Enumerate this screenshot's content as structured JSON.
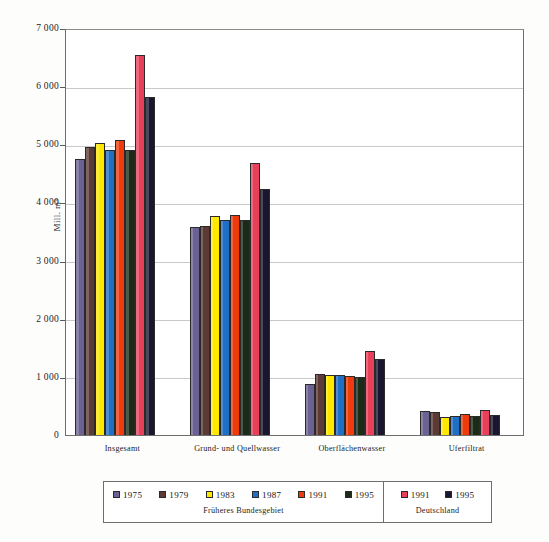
{
  "chart_data": {
    "type": "bar",
    "title": "",
    "xlabel": "",
    "ylabel": "Mill. m³",
    "ylim": [
      0,
      7000
    ],
    "ytick_labels": [
      "0",
      "1 000",
      "2 000",
      "3 000",
      "4 000",
      "5 000",
      "6 000",
      "7 000"
    ],
    "ytick_values": [
      0,
      1000,
      2000,
      3000,
      4000,
      5000,
      6000,
      7000
    ],
    "grid": true,
    "legend_position": "bottom",
    "categories": [
      "Insgesamt",
      "Grund- und Quellwasser",
      "Oberflächenwasser",
      "Uferfiltrat"
    ],
    "series": [
      {
        "name": "1975",
        "region": "Früheres Bundesgebiet",
        "color": "#6B6192",
        "values": [
          4750,
          3570,
          880,
          410
        ]
      },
      {
        "name": "1979",
        "region": "Früheres Bundesgebiet",
        "color": "#5C3A35",
        "values": [
          4950,
          3590,
          1050,
          390
        ]
      },
      {
        "name": "1983",
        "region": "Früheres Bundesgebiet",
        "color": "#FFE800",
        "values": [
          5030,
          3760,
          1040,
          310
        ]
      },
      {
        "name": "1987",
        "region": "Früheres Bundesgebiet",
        "color": "#1F6FC4",
        "values": [
          4910,
          3700,
          1030,
          330
        ]
      },
      {
        "name": "1991",
        "region": "Früheres Bundesgebiet",
        "color": "#EE3B0B",
        "values": [
          5080,
          3790,
          1010,
          360
        ]
      },
      {
        "name": "1995",
        "region": "Früheres Bundesgebiet",
        "color": "#1C2B17",
        "values": [
          4910,
          3700,
          1000,
          330
        ]
      },
      {
        "name": "1991",
        "region": "Deutschland",
        "color": "#E8405A",
        "values": [
          6530,
          4680,
          1450,
          430
        ]
      },
      {
        "name": "1995",
        "region": "Deutschland",
        "color": "#1A1630",
        "values": [
          5820,
          4230,
          1300,
          340
        ]
      }
    ]
  },
  "legend": {
    "west": {
      "caption": "Früheres Bundesgebiet",
      "entries": [
        {
          "label": "1975",
          "color": "#6B6192"
        },
        {
          "label": "1979",
          "color": "#5C3A35"
        },
        {
          "label": "1983",
          "color": "#FFE800"
        },
        {
          "label": "1987",
          "color": "#1F6FC4"
        },
        {
          "label": "1991",
          "color": "#EE3B0B"
        },
        {
          "label": "1995",
          "color": "#1C2B17"
        }
      ]
    },
    "germany": {
      "caption": "Deutschland",
      "entries": [
        {
          "label": "1991",
          "color": "#E8405A"
        },
        {
          "label": "1995",
          "color": "#1A1630"
        }
      ]
    }
  }
}
